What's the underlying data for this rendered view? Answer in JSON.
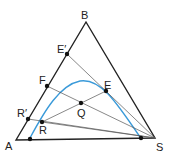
{
  "diagram": {
    "type": "ternary-phase-diagram",
    "vertices": {
      "A": "A",
      "B": "B",
      "S": "S"
    },
    "points": {
      "E_prime": "E′",
      "F": "F",
      "E": "E",
      "Q": "Q",
      "R_prime": "R′",
      "R": "R"
    },
    "colors": {
      "triangle": "#222222",
      "curve": "#3a9ad9",
      "tie_lines": "#555555",
      "points": "#111111"
    }
  }
}
